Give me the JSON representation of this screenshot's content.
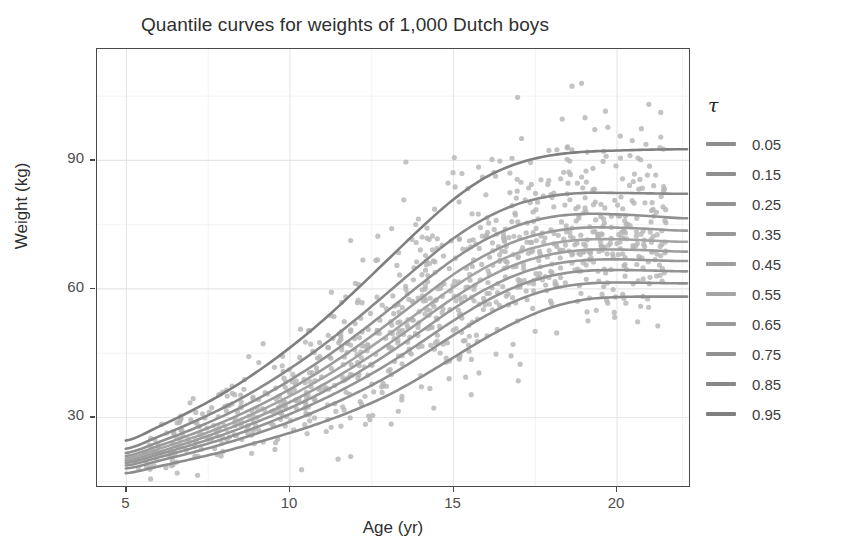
{
  "chart_data": {
    "type": "line",
    "title": "Quantile curves for weights of 1,000 Dutch boys",
    "xlabel": "Age (yr)",
    "ylabel": "Weight (kg)",
    "xlim": [
      4.1,
      22.2
    ],
    "ylim": [
      14,
      116
    ],
    "xticks": [
      5,
      10,
      15,
      20
    ],
    "yticks": [
      30,
      60,
      90
    ],
    "grid": true,
    "legend_position": "right",
    "legend_title": "τ",
    "x": [
      5,
      6,
      7,
      8,
      9,
      10,
      11,
      12,
      13,
      14,
      15,
      16,
      17,
      18,
      19,
      20,
      21,
      22
    ],
    "series": [
      {
        "name": "0.05",
        "color": "#8c8c8c",
        "values": [
          17.0,
          18.6,
          20.3,
          22.1,
          24.2,
          26.4,
          28.9,
          31.8,
          35.2,
          39.4,
          44.0,
          48.6,
          52.6,
          55.7,
          57.5,
          58.1,
          58.2,
          58.2
        ]
      },
      {
        "name": "0.15",
        "color": "#8f8f8f",
        "values": [
          18.1,
          19.9,
          21.8,
          23.9,
          26.3,
          29.0,
          32.1,
          35.6,
          39.6,
          44.3,
          49.2,
          53.8,
          57.5,
          60.0,
          61.2,
          61.5,
          61.4,
          61.3
        ]
      },
      {
        "name": "0.25",
        "color": "#939393",
        "values": [
          18.8,
          20.7,
          22.8,
          25.1,
          27.8,
          30.8,
          34.2,
          38.1,
          42.5,
          47.5,
          52.6,
          57.2,
          60.8,
          63.1,
          64.2,
          64.4,
          64.3,
          64.1
        ]
      },
      {
        "name": "0.35",
        "color": "#979797",
        "values": [
          19.4,
          21.4,
          23.6,
          26.1,
          29.0,
          32.2,
          35.9,
          40.1,
          44.9,
          50.1,
          55.4,
          60.0,
          63.5,
          65.7,
          66.7,
          66.9,
          66.7,
          66.5
        ]
      },
      {
        "name": "0.45",
        "color": "#9d9d9d",
        "values": [
          19.9,
          22.0,
          24.4,
          27.1,
          30.1,
          33.6,
          37.6,
          42.1,
          47.1,
          52.5,
          57.9,
          62.5,
          66.0,
          68.1,
          69.1,
          69.2,
          69.0,
          68.7
        ]
      },
      {
        "name": "0.55",
        "color": "#a4a4a4",
        "values": [
          20.4,
          22.7,
          25.2,
          28.0,
          31.3,
          35.0,
          39.2,
          44.0,
          49.3,
          54.9,
          60.4,
          65.1,
          68.5,
          70.6,
          71.5,
          71.6,
          71.3,
          71.0
        ]
      },
      {
        "name": "0.65",
        "color": "#9a9a9a",
        "values": [
          21.0,
          23.4,
          26.1,
          29.1,
          32.6,
          36.6,
          41.2,
          46.3,
          51.9,
          57.7,
          63.4,
          68.0,
          71.4,
          73.4,
          74.3,
          74.3,
          74.0,
          73.6
        ]
      },
      {
        "name": "0.75",
        "color": "#909090",
        "values": [
          21.7,
          24.3,
          27.2,
          30.5,
          34.3,
          38.7,
          43.6,
          49.1,
          55.0,
          61.1,
          66.9,
          71.6,
          74.9,
          76.8,
          77.5,
          77.4,
          77.0,
          76.5
        ]
      },
      {
        "name": "0.85",
        "color": "#888888",
        "values": [
          22.7,
          25.6,
          28.8,
          32.4,
          36.6,
          41.4,
          46.8,
          52.8,
          59.2,
          65.7,
          71.8,
          76.6,
          79.9,
          81.7,
          82.4,
          82.4,
          82.3,
          82.2
        ]
      },
      {
        "name": "0.95",
        "color": "#7f7f7f",
        "values": [
          24.6,
          27.9,
          31.6,
          35.8,
          40.7,
          46.3,
          52.6,
          59.6,
          66.9,
          74.2,
          80.9,
          86.1,
          89.4,
          91.2,
          92.0,
          92.3,
          92.5,
          92.6
        ]
      }
    ],
    "scatter": {
      "name": "Dutch boys weight observations",
      "n_points": 1000,
      "color": "#b6b6b6",
      "point_size": 2.6
    }
  }
}
